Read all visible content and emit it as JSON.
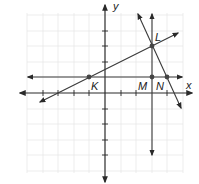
{
  "diagram": {
    "type": "coordinate-plane",
    "axes": {
      "x_label": "x",
      "y_label": "y"
    },
    "grid": {
      "x_range": [
        -5,
        5
      ],
      "y_range": [
        -5,
        5
      ],
      "unit_px": 15.6,
      "origin_px": [
        105,
        93
      ]
    },
    "points": [
      {
        "name": "K",
        "x": -1,
        "y": 1
      },
      {
        "name": "L",
        "x": 3,
        "y": 3
      },
      {
        "name": "M",
        "x": 3,
        "y": 1
      },
      {
        "name": "N",
        "x": 4,
        "y": 1
      }
    ],
    "lines": [
      {
        "name": "line-KL",
        "through": [
          "K",
          "L"
        ],
        "description": "slanted line through K and L"
      },
      {
        "name": "line-horizontal-y1",
        "through": [
          "K",
          "M",
          "N"
        ],
        "description": "horizontal line y = 1"
      },
      {
        "name": "line-vertical-x3",
        "through": [
          "L",
          "M"
        ],
        "description": "vertical line x = 3"
      },
      {
        "name": "line-LN",
        "through": [
          "L",
          "N"
        ],
        "description": "steep line through L and N"
      }
    ],
    "colors": {
      "line": "#3a3a3a",
      "grid": "#e6e6e6",
      "point": "#444444"
    }
  }
}
